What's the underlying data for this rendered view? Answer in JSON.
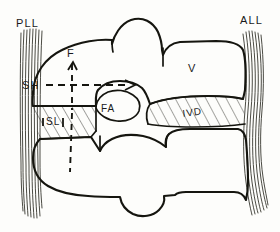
{
  "figure": {
    "background_color": "#fdfdfb",
    "ink_color": "#15150f"
  },
  "labels": {
    "pll": "PLL",
    "all": "ALL",
    "sh": "SH",
    "f": "F",
    "v": "V",
    "fa": "FA",
    "ivd": "IVD",
    "sl": "SL"
  },
  "annotations": {
    "shear_arrow": "horizontal-dashed-arrow-right",
    "force_arrow": "vertical-dashed-arrow-up",
    "vertical_axis": "vertical-dashed-reference-line"
  },
  "structures": [
    {
      "name": "posterior-longitudinal-ligament",
      "abbr": "PLL",
      "style": "fiber-band-left"
    },
    {
      "name": "anterior-longitudinal-ligament",
      "abbr": "ALL",
      "style": "fiber-band-right"
    },
    {
      "name": "upper-vertebra",
      "abbr": "V",
      "style": "outline"
    },
    {
      "name": "lower-vertebra",
      "abbr": "",
      "style": "outline"
    },
    {
      "name": "intervertebral-disc",
      "abbr": "IVD",
      "style": "hatched"
    },
    {
      "name": "supraspinous-interspinous-ligament",
      "abbr": "SL",
      "style": "hatched"
    },
    {
      "name": "facet-articulation",
      "abbr": "FA",
      "style": "outline"
    }
  ]
}
